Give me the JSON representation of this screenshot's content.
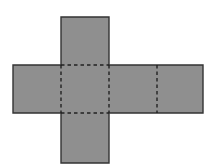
{
  "diagram": {
    "type": "cube-net",
    "colors": {
      "background": "#ffffff",
      "face_fill": "#8f8f8f",
      "outline": "#333333",
      "fold_line": "#222222"
    },
    "face_size": 48,
    "faces": [
      {
        "id": "top",
        "x": 61,
        "y": 17
      },
      {
        "id": "left",
        "x": 13,
        "y": 65
      },
      {
        "id": "center",
        "x": 61,
        "y": 65
      },
      {
        "id": "right",
        "x": 109,
        "y": 65
      },
      {
        "id": "far-right",
        "x": 157,
        "y": 65
      },
      {
        "id": "bottom",
        "x": 61,
        "y": 113
      }
    ],
    "fold_lines": [
      {
        "x1": 61,
        "y1": 65,
        "x2": 109,
        "y2": 65
      },
      {
        "x1": 61,
        "y1": 113,
        "x2": 109,
        "y2": 113
      },
      {
        "x1": 61,
        "y1": 65,
        "x2": 61,
        "y2": 113
      },
      {
        "x1": 109,
        "y1": 65,
        "x2": 109,
        "y2": 113
      },
      {
        "x1": 157,
        "y1": 65,
        "x2": 157,
        "y2": 113
      }
    ]
  }
}
